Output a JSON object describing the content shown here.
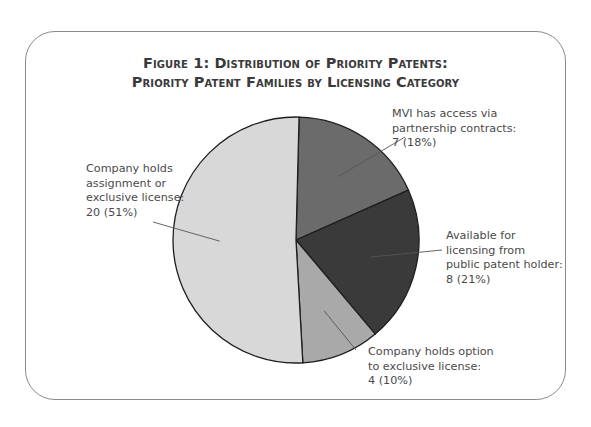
{
  "chart_data": {
    "type": "pie",
    "title": "Figure 1: Distribution of Priority Patents:",
    "subtitle": "Priority Patent Families by Licensing Category",
    "total": 39,
    "slices": [
      {
        "name": "MVI has access via partnership contracts",
        "value": 7,
        "percent": 18,
        "color": "#6b6b6b",
        "label_lines": [
          "MVI has access via",
          "partnership contracts:",
          "7 (18%)"
        ]
      },
      {
        "name": "Available for licensing from public patent holder",
        "value": 8,
        "percent": 21,
        "color": "#3a3a3a",
        "label_lines": [
          "Available for",
          "licensing from",
          "public patent holder:",
          "8 (21%)"
        ]
      },
      {
        "name": "Company holds option to exclusive license",
        "value": 4,
        "percent": 10,
        "color": "#a9a9a9",
        "label_lines": [
          "Company holds option",
          "to exclusive license:",
          "4 (10%)"
        ]
      },
      {
        "name": "Company holds assignment or exclusive license",
        "value": 20,
        "percent": 51,
        "color": "#d8d8d8",
        "label_lines": [
          "Company holds",
          "assignment or",
          "exclusive license:",
          "20 (51%)"
        ]
      }
    ],
    "start_direction": "top",
    "direction": "clockwise",
    "legend": "none"
  }
}
